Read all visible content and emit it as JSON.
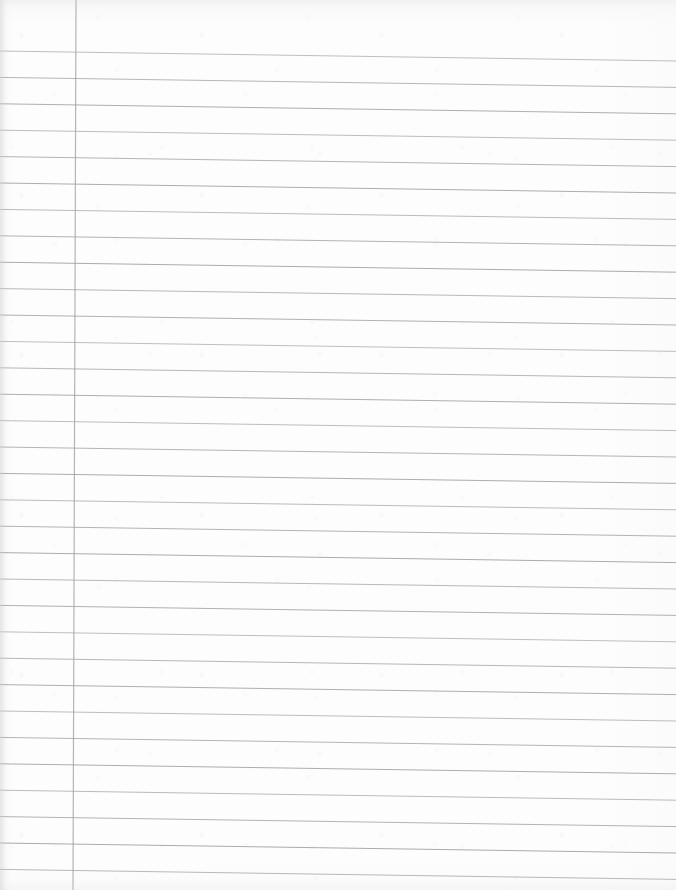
{
  "document": {
    "type": "lined-notebook-paper",
    "description": "Blank scanned sheet of ruled notebook paper",
    "orientation": "portrait",
    "written_content": "",
    "page_width": 676,
    "page_height": 890
  },
  "paper": {
    "background_color": "#fdfdfd",
    "edge_shadow_color": "#d2d2d6",
    "texture": "scanned-paper-grain"
  },
  "ruling": {
    "rule_color": "#9a9aa0",
    "rule_thickness": 0.9,
    "rule_spacing": 26.4,
    "first_rule_y": 51,
    "rule_count": 32,
    "slant_drop_px": 10,
    "line_start_x": 0,
    "line_end_x": 676,
    "margin_line_color": "#a0a0a6",
    "margin_line_thickness": 1.2,
    "margin_line_x_top": 76,
    "margin_line_x_bottom": 73,
    "margin_line_y_start": 0,
    "margin_line_y_end": 890
  },
  "header_area": {
    "label": "unruled top margin",
    "height": 51
  }
}
